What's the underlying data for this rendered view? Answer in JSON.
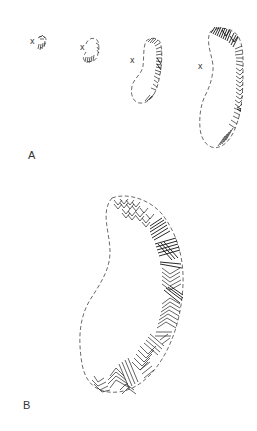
{
  "figure": {
    "panels": [
      {
        "id": "A",
        "label": "A",
        "description": "Four successive stages of outlined regions with hatched growth along one edge",
        "stages": [
          {
            "index": 1,
            "marker": "x"
          },
          {
            "index": 2,
            "marker": "x"
          },
          {
            "index": 3,
            "marker": "x"
          },
          {
            "index": 4,
            "marker": "x"
          }
        ]
      },
      {
        "id": "B",
        "label": "B",
        "description": "Enlarged kidney-shaped outline with dense patterned hatching along the right and bottom edge"
      }
    ],
    "colors": {
      "background": "#ffffff",
      "line": "#222222",
      "outline": "#444444"
    }
  }
}
